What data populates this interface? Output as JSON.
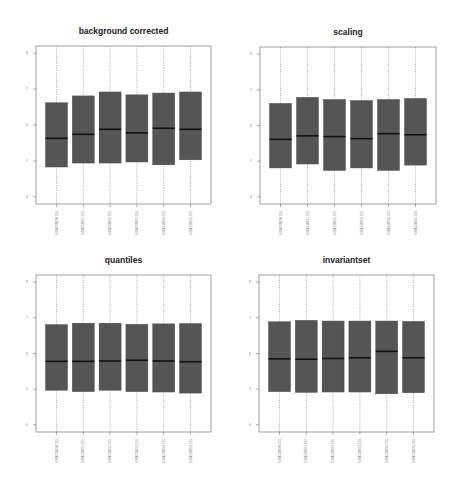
{
  "figure": {
    "box_fill": "#555555",
    "median_color": "#111111",
    "frame_color": "#777777",
    "whisker_color": "#888888",
    "background": "#ffffff"
  },
  "chart_data": [
    {
      "type": "box",
      "title": "background corrected",
      "xlabel": "",
      "ylabel": "",
      "ylim": [
        3.8,
        8.2
      ],
      "yticks": [
        4,
        5,
        6,
        7,
        8
      ],
      "categories": [
        "GSM238990.CEL",
        "GSM238991.CEL",
        "GSM238992.CEL",
        "GSM238993.CEL",
        "GSM238994.CEL",
        "GSM238995.CEL"
      ],
      "series": [
        {
          "name": "q1",
          "values": [
            4.83,
            4.94,
            4.94,
            4.97,
            4.89,
            5.03
          ]
        },
        {
          "name": "median",
          "values": [
            5.63,
            5.74,
            5.88,
            5.78,
            5.91,
            5.88
          ]
        },
        {
          "name": "q3",
          "values": [
            6.62,
            6.81,
            6.92,
            6.84,
            6.89,
            6.92
          ]
        }
      ],
      "whiskers_extend_beyond_axes": true,
      "grid": false
    },
    {
      "type": "box",
      "title": "scaling",
      "xlabel": "",
      "ylabel": "",
      "ylim": [
        3.8,
        8.2
      ],
      "yticks": [
        4,
        5,
        6,
        7,
        8
      ],
      "categories": [
        "GSM238990.CEL",
        "GSM238991.CEL",
        "GSM238992.CEL",
        "GSM238993.CEL",
        "GSM238994.CEL",
        "GSM238995.CEL"
      ],
      "series": [
        {
          "name": "q1",
          "values": [
            4.81,
            4.92,
            4.74,
            4.81,
            4.74,
            4.89
          ]
        },
        {
          "name": "median",
          "values": [
            5.61,
            5.71,
            5.69,
            5.63,
            5.77,
            5.74
          ]
        },
        {
          "name": "q3",
          "values": [
            6.62,
            6.79,
            6.73,
            6.7,
            6.73,
            6.76
          ]
        }
      ],
      "whiskers_extend_beyond_axes": true,
      "grid": false
    },
    {
      "type": "box",
      "title": "quantiles",
      "xlabel": "",
      "ylabel": "",
      "ylim": [
        3.8,
        8.2
      ],
      "yticks": [
        4,
        5,
        6,
        7,
        8
      ],
      "categories": [
        "GSM238990.CEL",
        "GSM238991.CEL",
        "GSM238992.CEL",
        "GSM238993.CEL",
        "GSM238994.CEL",
        "GSM238995.CEL"
      ],
      "series": [
        {
          "name": "q1",
          "values": [
            4.97,
            4.93,
            4.97,
            4.93,
            4.92,
            4.89
          ]
        },
        {
          "name": "median",
          "values": [
            5.78,
            5.78,
            5.79,
            5.81,
            5.79,
            5.77
          ]
        },
        {
          "name": "q3",
          "values": [
            6.81,
            6.85,
            6.85,
            6.82,
            6.83,
            6.84
          ]
        }
      ],
      "whiskers_extend_beyond_axes": true,
      "grid": false
    },
    {
      "type": "box",
      "title": "invariantset",
      "xlabel": "",
      "ylabel": "",
      "ylim": [
        3.8,
        8.2
      ],
      "yticks": [
        4,
        5,
        6,
        7,
        8
      ],
      "categories": [
        "GSM238990.CEL",
        "GSM238991.CEL",
        "GSM238992.CEL",
        "GSM238993.CEL",
        "GSM238994.CEL",
        "GSM238995.CEL"
      ],
      "series": [
        {
          "name": "q1",
          "values": [
            4.93,
            4.91,
            4.92,
            4.92,
            4.87,
            4.9
          ]
        },
        {
          "name": "median",
          "values": [
            5.85,
            5.84,
            5.86,
            5.88,
            6.06,
            5.88
          ]
        },
        {
          "name": "q3",
          "values": [
            6.89,
            6.93,
            6.91,
            6.91,
            6.91,
            6.9
          ]
        }
      ],
      "whiskers_extend_beyond_axes": true,
      "grid": false
    }
  ],
  "layout": {
    "panels": [
      {
        "frame": [
          36,
          46,
          211,
          204
        ]
      },
      {
        "frame": [
          260,
          47,
          436,
          204
        ]
      },
      {
        "frame": [
          36,
          275,
          211,
          432
        ]
      },
      {
        "frame": [
          259,
          275,
          434,
          432
        ]
      }
    ]
  }
}
